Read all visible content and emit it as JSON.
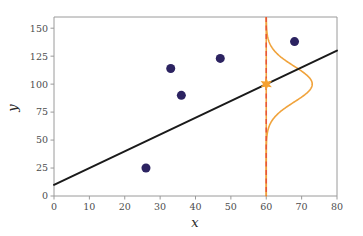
{
  "chart_data": {
    "type": "scatter",
    "title": "",
    "xlabel": "x",
    "ylabel": "y",
    "xlim": [
      0,
      80
    ],
    "ylim": [
      0,
      160
    ],
    "grid": false,
    "legend": null,
    "xticks": [
      0,
      10,
      20,
      30,
      40,
      50,
      60,
      70,
      80
    ],
    "xticklabels": [
      "0",
      "10",
      "20",
      "30",
      "40",
      "50",
      "60",
      "70",
      "80"
    ],
    "yticks": [
      0,
      25,
      50,
      75,
      100,
      125,
      150
    ],
    "yticklabels": [
      "0",
      "25",
      "50",
      "75",
      "100",
      "125",
      "150"
    ],
    "series": [
      {
        "name": "observations",
        "type": "scatter",
        "color": "#2c2361",
        "marker": "circle",
        "marker_size": 9,
        "points": [
          {
            "x": 26,
            "y": 25
          },
          {
            "x": 33,
            "y": 114
          },
          {
            "x": 36,
            "y": 90
          },
          {
            "x": 47,
            "y": 123
          },
          {
            "x": 68,
            "y": 138
          }
        ]
      },
      {
        "name": "regression-line",
        "type": "line",
        "color": "#1a1a1a",
        "linewidth": 2.0,
        "x": [
          0,
          80
        ],
        "values": [
          10,
          130
        ]
      },
      {
        "name": "prediction-marker",
        "type": "scatter",
        "color": "#f5a030",
        "marker": "star",
        "marker_size": 11,
        "points": [
          {
            "x": 60,
            "y": 100
          }
        ]
      },
      {
        "name": "prediction-vline",
        "type": "vline",
        "color": "#e8553a",
        "linestyle": "dashed",
        "x": 60
      },
      {
        "name": "conditional-density",
        "type": "line",
        "color": "#f0a33c",
        "linewidth": 1.6,
        "orientation": "vertical",
        "center_x": 60,
        "mean": 100,
        "sigma": 16,
        "amplitude_x": 13,
        "description": "Gaussian density of y at x = 60, drawn sideways from the vertical line at x = 60"
      }
    ]
  },
  "axes": {
    "x_axis_label": "x",
    "y_axis_label": "y"
  }
}
